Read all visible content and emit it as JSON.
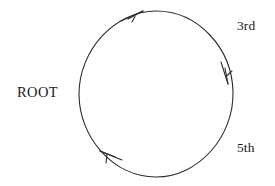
{
  "canvas": {
    "width": 275,
    "height": 186,
    "background_color": "#ffffff",
    "ink_color": "#2b2b2b"
  },
  "diagram": {
    "type": "cycle",
    "circle": {
      "center_x": 156,
      "center_y": 94,
      "radius_x": 77,
      "radius_y": 83,
      "stroke_color": "#2b2b2b",
      "stroke_width": 1.1
    },
    "arrowheads": [
      {
        "name": "arrowhead-top",
        "tip_x": 143,
        "tip_y": 11,
        "direction": "clockwise",
        "angle_deg": -15
      },
      {
        "name": "arrowhead-right",
        "tip_x": 228,
        "tip_y": 84,
        "direction": "clockwise",
        "angle_deg": 97
      },
      {
        "name": "arrowhead-bottom-left",
        "tip_x": 100,
        "tip_y": 151,
        "direction": "clockwise",
        "angle_deg": 215
      }
    ]
  },
  "labels": {
    "root": "ROOT",
    "third": "3rd",
    "fifth": "5th"
  }
}
